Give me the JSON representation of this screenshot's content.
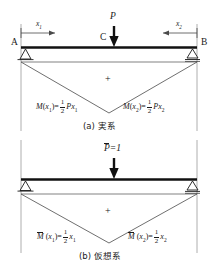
{
  "figure": {
    "title_absent": true,
    "panels": [
      {
        "id": "a",
        "caption": "(a) 実系",
        "caption_letter": "(a)",
        "caption_text": "実系",
        "support_left_label": "A",
        "support_right_label": "B",
        "load_point_label": "C",
        "load_label": "P",
        "dim_left_label": "x",
        "dim_left_sub": "1",
        "dim_right_label": "x",
        "dim_right_sub": "2",
        "sign_label": "+",
        "eq_left": {
          "fn": "M",
          "arg": "x",
          "arg_sub": "1",
          "eq": "=",
          "num": "1",
          "den": "2",
          "tail": "P",
          "tail_var": "x",
          "tail_sub": "1"
        },
        "eq_right": {
          "fn": "M",
          "arg": "x",
          "arg_sub": "2",
          "eq": "=",
          "num": "1",
          "den": "2",
          "tail": "P",
          "tail_var": "x",
          "tail_sub": "2"
        }
      },
      {
        "id": "b",
        "caption": "(b) 仮想系",
        "caption_letter": "(b)",
        "caption_text": "仮想系",
        "load_label": "P",
        "load_value": "=1",
        "load_overbar": true,
        "sign_label": "+",
        "eq_left": {
          "fn": "M",
          "overbar": true,
          "arg": "x",
          "arg_sub": "1",
          "eq": "=",
          "num": "1",
          "den": "2",
          "tail_var": "x",
          "tail_sub": "1"
        },
        "eq_right": {
          "fn": "M",
          "overbar": true,
          "arg": "x",
          "arg_sub": "2",
          "eq": "=",
          "num": "1",
          "den": "2",
          "tail_var": "x",
          "tail_sub": "2"
        }
      }
    ],
    "colors": {
      "ink": "#1a1a1a",
      "beam": "#111111",
      "thin_line": "#4a4a4a",
      "guide_line": "#9a9a9a"
    }
  }
}
